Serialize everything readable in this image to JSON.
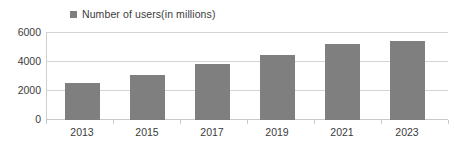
{
  "chart_data": {
    "type": "bar",
    "title": "",
    "subtitle": "",
    "xlabel": "",
    "ylabel": "",
    "categories": [
      "2013",
      "2015",
      "2017",
      "2019",
      "2021",
      "2023"
    ],
    "series": [
      {
        "name": "Number of users(in millions)",
        "color": "#7f7f7f",
        "values": [
          2500,
          3050,
          3800,
          4420,
          5170,
          5380
        ]
      }
    ],
    "ylim": [
      0,
      6000
    ],
    "yticks": [
      0,
      2000,
      4000,
      6000
    ],
    "ytick_labels": [
      "0",
      "2000",
      "4000",
      "6000"
    ],
    "grid": true,
    "grid_axis": "y",
    "legend": {
      "position": "top",
      "entries": [
        {
          "label": "Number of users(in millions)",
          "color": "#7f7f7f"
        }
      ]
    }
  },
  "legend": {
    "label": "Number of users(in millions)"
  },
  "axis": {
    "y": {
      "labels": [
        "6000",
        "4000",
        "2000",
        "0"
      ]
    },
    "x": {
      "labels": [
        "2013",
        "2015",
        "2017",
        "2019",
        "2021",
        "2023"
      ]
    }
  },
  "colors": {
    "bar": "#7f7f7f",
    "grid": "#d4d4d4",
    "text": "#3b3b3b",
    "background": "#ffffff"
  }
}
